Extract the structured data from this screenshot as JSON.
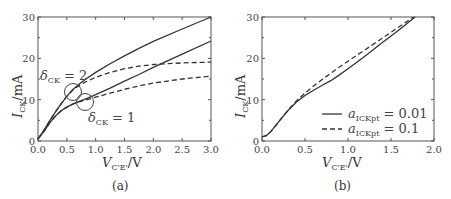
{
  "chart_data": [
    {
      "panel": "(a)",
      "type": "line",
      "xlabel": "V_C'E' / V",
      "ylabel": "I_CK / mA",
      "xlim": [
        0,
        3.0
      ],
      "ylim": [
        0,
        30
      ],
      "xticks": [
        "0.0",
        "0.5",
        "1.0",
        "1.5",
        "2.0",
        "2.5",
        "3.0"
      ],
      "yticks": [
        "0",
        "10",
        "20",
        "30"
      ],
      "grid": false,
      "annotations": [
        {
          "text": "δ_CK = 2",
          "x": 0.61,
          "y": 11.8,
          "circle": true
        },
        {
          "text": "δ_CK = 1",
          "x": 0.82,
          "y": 9.4,
          "circle": true
        }
      ],
      "series": [
        {
          "name": "δ_CK = 2 solid",
          "style": "solid",
          "x": [
            0,
            0.1,
            0.2,
            0.3,
            0.4,
            0.5,
            0.6,
            0.7,
            0.8,
            1.0,
            1.25,
            1.5,
            1.75,
            2.0,
            2.5,
            3.0
          ],
          "y": [
            0.5,
            2.5,
            4.8,
            7.0,
            9.0,
            10.8,
            12.4,
            13.6,
            14.7,
            16.6,
            18.7,
            20.6,
            22.4,
            24.1,
            27.1,
            30.0
          ]
        },
        {
          "name": "δ_CK = 2 dashed",
          "style": "dashed",
          "x": [
            0,
            0.1,
            0.2,
            0.3,
            0.4,
            0.5,
            0.6,
            0.7,
            0.8,
            1.0,
            1.25,
            1.5,
            1.75,
            2.0,
            2.5,
            3.0
          ],
          "y": [
            0.5,
            2.5,
            4.8,
            7.0,
            9.0,
            10.8,
            12.3,
            13.3,
            14.1,
            15.4,
            16.6,
            17.5,
            18.1,
            18.5,
            18.9,
            19.1
          ]
        },
        {
          "name": "δ_CK = 1 solid",
          "style": "solid",
          "x": [
            0,
            0.1,
            0.2,
            0.3,
            0.4,
            0.5,
            0.6,
            0.7,
            0.8,
            1.0,
            1.25,
            1.5,
            1.75,
            2.0,
            2.5,
            3.0
          ],
          "y": [
            0.5,
            2.3,
            4.3,
            6.0,
            7.3,
            8.2,
            8.9,
            9.5,
            10.0,
            11.2,
            12.8,
            14.5,
            16.1,
            17.8,
            21.0,
            24.2
          ]
        },
        {
          "name": "δ_CK = 1 dashed",
          "style": "dashed",
          "x": [
            0,
            0.1,
            0.2,
            0.3,
            0.4,
            0.5,
            0.6,
            0.7,
            0.8,
            1.0,
            1.25,
            1.5,
            1.75,
            2.0,
            2.5,
            3.0
          ],
          "y": [
            0.5,
            2.3,
            4.3,
            6.0,
            7.3,
            8.2,
            8.9,
            9.4,
            9.8,
            10.6,
            11.6,
            12.5,
            13.3,
            14.0,
            15.0,
            15.7
          ]
        }
      ]
    },
    {
      "panel": "(b)",
      "type": "line",
      "xlabel": "V_C'E' / V",
      "ylabel": "I_CK / mA",
      "xlim": [
        0,
        2.0
      ],
      "ylim": [
        0,
        30
      ],
      "xticks": [
        "0.0",
        "0.5",
        "1.0",
        "1.5",
        "2.0"
      ],
      "yticks": [
        "0",
        "10",
        "20",
        "30"
      ],
      "grid": false,
      "legend_position": "lower right",
      "series": [
        {
          "name": "a_ICKpt = 0.01",
          "style": "solid",
          "x": [
            0,
            0.05,
            0.1,
            0.2,
            0.3,
            0.4,
            0.5,
            0.6,
            0.7,
            0.8,
            0.9,
            1.0,
            1.2,
            1.4,
            1.6,
            1.78
          ],
          "y": [
            1.0,
            1.3,
            2.2,
            4.8,
            7.3,
            9.4,
            11.0,
            12.3,
            13.5,
            14.6,
            16.0,
            17.5,
            20.6,
            23.8,
            27.0,
            30.0
          ]
        },
        {
          "name": "a_ICKpt = 0.1",
          "style": "dashed",
          "x": [
            0,
            0.05,
            0.1,
            0.2,
            0.3,
            0.4,
            0.5,
            0.6,
            0.7,
            0.8,
            0.9,
            1.0,
            1.2,
            1.4,
            1.6,
            1.76
          ],
          "y": [
            1.0,
            1.3,
            2.2,
            4.8,
            7.4,
            9.7,
            11.6,
            13.3,
            14.9,
            16.4,
            17.9,
            19.3,
            22.1,
            24.9,
            27.7,
            30.0
          ]
        }
      ]
    }
  ],
  "panels": {
    "a": {
      "caption": "(a)",
      "ylabel_main": "I",
      "ylabel_sub": "CK",
      "ylabel_unit": "/mA",
      "xlabel_main": "V",
      "xlabel_sub": "C'E'",
      "xlabel_unit": "/V",
      "annot1_main": "δ",
      "annot1_sub": "CK",
      "annot1_val": " = 2",
      "annot2_main": "δ",
      "annot2_sub": "CK",
      "annot2_val": " = 1"
    },
    "b": {
      "caption": "(b)",
      "ylabel_main": "I",
      "ylabel_sub": "CK",
      "ylabel_unit": "/mA",
      "xlabel_main": "V",
      "xlabel_sub": "C'E'",
      "xlabel_unit": "/V",
      "legend": [
        {
          "main": "a",
          "sub": "ICKpt",
          "val": " = 0.01"
        },
        {
          "main": "a",
          "sub": "ICKpt",
          "val": " = 0.1"
        }
      ]
    }
  }
}
